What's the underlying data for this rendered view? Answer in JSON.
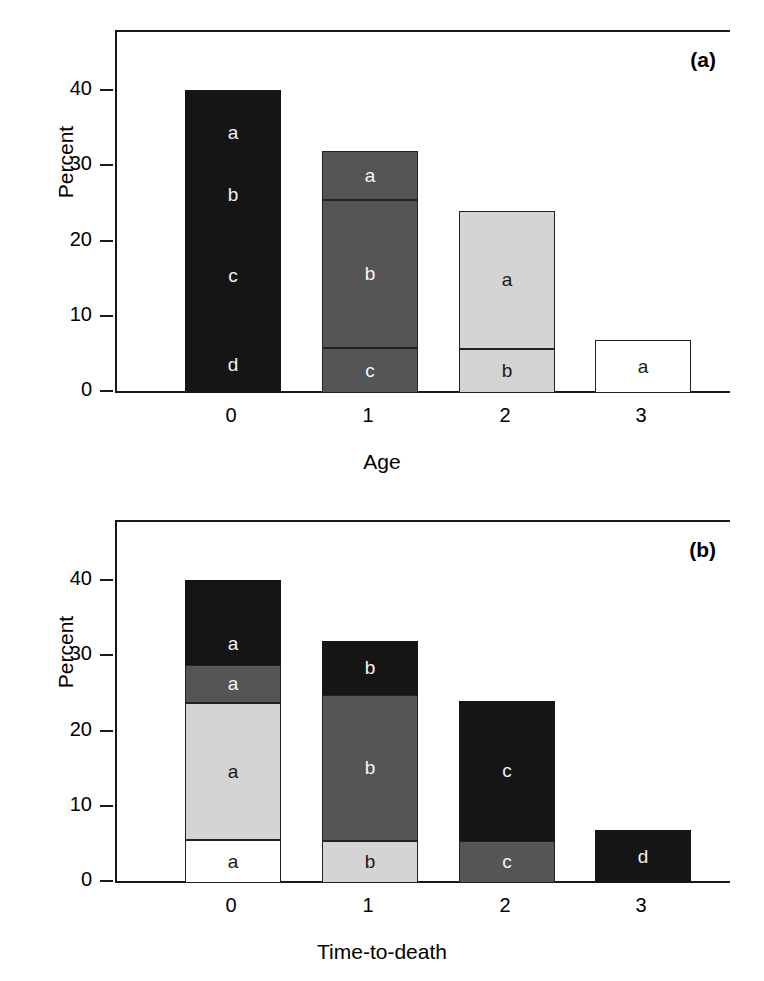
{
  "figure": {
    "panels": [
      {
        "key": "a",
        "label": "(a)",
        "ylabel": "Percent",
        "xlabel": "Age",
        "yticks": [
          "0",
          "10",
          "20",
          "30",
          "40"
        ],
        "xticks": [
          "0",
          "1",
          "2",
          "3"
        ]
      },
      {
        "key": "b",
        "label": "(b)",
        "ylabel": "Percent",
        "xlabel": "Time-to-death",
        "yticks": [
          "0",
          "10",
          "20",
          "30",
          "40"
        ],
        "xticks": [
          "0",
          "1",
          "2",
          "3"
        ]
      }
    ]
  },
  "chart_data": [
    {
      "type": "bar",
      "id": "panel-a",
      "title": "(a)",
      "stacked": true,
      "xlabel": "Age",
      "ylabel": "Percent",
      "categories": [
        "0",
        "1",
        "2",
        "3"
      ],
      "ylim": [
        0,
        47
      ],
      "yticks": [
        0,
        10,
        20,
        30,
        40
      ],
      "grid": false,
      "legend": "none",
      "totals": [
        40.2,
        32.2,
        24.2,
        7.0
      ],
      "bars": [
        {
          "category": "0",
          "total": 40.2,
          "fill": "black",
          "segments": [
            {
              "label": "d",
              "from": 0.0,
              "to": 7.5,
              "value": 7.5,
              "fill": "black"
            },
            {
              "label": "c",
              "from": 7.5,
              "to": 23.7,
              "value": 16.2,
              "fill": "black"
            },
            {
              "label": "b",
              "from": 23.7,
              "to": 29.1,
              "value": 5.4,
              "fill": "black"
            },
            {
              "label": "a",
              "from": 29.1,
              "to": 40.2,
              "value": 11.1,
              "fill": "black"
            }
          ]
        },
        {
          "category": "1",
          "total": 32.2,
          "fill": "dark",
          "segments": [
            {
              "label": "c",
              "from": 0.0,
              "to": 6.0,
              "value": 6.0,
              "fill": "dark"
            },
            {
              "label": "b",
              "from": 6.0,
              "to": 25.7,
              "value": 19.7,
              "fill": "dark"
            },
            {
              "label": "a",
              "from": 25.7,
              "to": 32.2,
              "value": 6.5,
              "fill": "dark"
            }
          ]
        },
        {
          "category": "2",
          "total": 24.2,
          "fill": "light",
          "segments": [
            {
              "label": "b",
              "from": 0.0,
              "to": 5.9,
              "value": 5.9,
              "fill": "light"
            },
            {
              "label": "a",
              "from": 5.9,
              "to": 24.2,
              "value": 18.3,
              "fill": "light"
            }
          ]
        },
        {
          "category": "3",
          "total": 7.0,
          "fill": "white",
          "segments": [
            {
              "label": "a",
              "from": 0.0,
              "to": 7.0,
              "value": 7.0,
              "fill": "white"
            }
          ]
        }
      ]
    },
    {
      "type": "bar",
      "id": "panel-b",
      "title": "(b)",
      "stacked": true,
      "xlabel": "Time-to-death",
      "ylabel": "Percent",
      "categories": [
        "0",
        "1",
        "2",
        "3"
      ],
      "ylim": [
        0,
        47
      ],
      "yticks": [
        0,
        10,
        20,
        30,
        40
      ],
      "grid": false,
      "legend": "none",
      "totals": [
        40.2,
        32.2,
        24.2,
        7.0
      ],
      "bars": [
        {
          "category": "0",
          "total": 40.2,
          "segments": [
            {
              "label": "a",
              "from": 0.0,
              "to": 5.7,
              "value": 5.7,
              "fill": "white"
            },
            {
              "label": "a",
              "from": 5.7,
              "to": 23.9,
              "value": 18.2,
              "fill": "light"
            },
            {
              "label": "a",
              "from": 23.9,
              "to": 29.0,
              "value": 5.1,
              "fill": "dark"
            },
            {
              "label": "a",
              "from": 29.0,
              "to": 34.7,
              "value": 5.7,
              "fill": "black"
            },
            {
              "label": "",
              "from": 34.7,
              "to": 40.2,
              "value": 5.5,
              "fill": "black"
            }
          ]
        },
        {
          "category": "1",
          "total": 32.2,
          "segments": [
            {
              "label": "b",
              "from": 0.0,
              "to": 5.6,
              "value": 5.6,
              "fill": "light"
            },
            {
              "label": "b",
              "from": 5.6,
              "to": 25.0,
              "value": 19.4,
              "fill": "dark"
            },
            {
              "label": "b",
              "from": 25.0,
              "to": 32.2,
              "value": 7.2,
              "fill": "black"
            }
          ]
        },
        {
          "category": "2",
          "total": 24.2,
          "segments": [
            {
              "label": "c",
              "from": 0.0,
              "to": 5.6,
              "value": 5.6,
              "fill": "dark"
            },
            {
              "label": "c",
              "from": 5.6,
              "to": 24.2,
              "value": 18.6,
              "fill": "black"
            }
          ]
        },
        {
          "category": "3",
          "total": 7.0,
          "segments": [
            {
              "label": "d",
              "from": 0.0,
              "to": 7.0,
              "value": 7.0,
              "fill": "black"
            }
          ]
        }
      ]
    }
  ]
}
